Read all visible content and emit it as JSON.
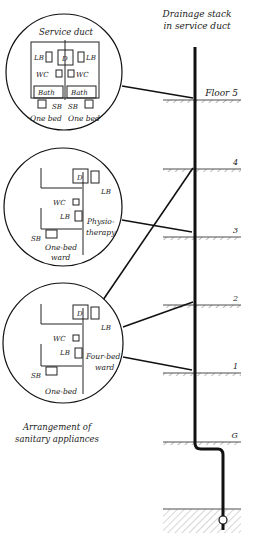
{
  "stack_title": [
    "Drainage stack",
    "in service duct"
  ],
  "floors": [
    {
      "label": "Floor 5",
      "y": 100
    },
    {
      "label": "4",
      "y": 169
    },
    {
      "label": "3",
      "y": 237
    },
    {
      "label": "2",
      "y": 305
    },
    {
      "label": "1",
      "y": 373
    },
    {
      "label": "G",
      "y": 441
    }
  ],
  "detail_top": {
    "title": "Service duct",
    "labels": {
      "lb_left": "LB",
      "d": "D",
      "lb_right": "LB",
      "wc_left": "WC",
      "wc_right": "WC",
      "bath_left": "Bath",
      "bath_right": "Bath",
      "sb_left": "SB",
      "sb_right": "SB",
      "bed_left": "One bed",
      "bed_right": "One bed"
    }
  },
  "detail_middle": {
    "labels": {
      "d": "D",
      "lb_top": "LB",
      "wc": "WC",
      "lb": "LB",
      "sb": "SB",
      "room": "Physio-",
      "room2": "therapy",
      "ward": "One-bed",
      "ward2": "ward"
    }
  },
  "detail_bottom": {
    "labels": {
      "d": "D",
      "lb_top": "LB",
      "wc": "WC",
      "lb": "LB",
      "sb": "SB",
      "room": "Four-bed",
      "room2": "ward",
      "ward": "One-bed"
    }
  },
  "caption": [
    "Arrangement of",
    "sanitary appliances"
  ]
}
